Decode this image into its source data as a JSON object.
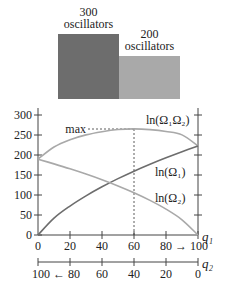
{
  "illustration": {
    "system1_label": [
      "300",
      "oscillators"
    ],
    "system2_label": [
      "200",
      "oscillators"
    ],
    "system1_color": "#6d6d6d",
    "system2_color": "#a9a9a9"
  },
  "chart_data": {
    "type": "line",
    "title": "",
    "xlabel": "q1",
    "x2label": "q2",
    "ylabel": "",
    "xlim": [
      0,
      100
    ],
    "ylim": [
      0,
      300
    ],
    "grid": false,
    "x_ticks": [
      0,
      20,
      40,
      60,
      80,
      100
    ],
    "x_tick_labels": [
      "0",
      "20",
      "40",
      "60",
      "80 → 100"
    ],
    "x2_ticks": [
      100,
      80,
      60,
      40,
      20,
      0
    ],
    "x2_tick_labels": [
      "100 ← 80",
      "60",
      "40",
      "20",
      "0"
    ],
    "y_ticks": [
      0,
      50,
      100,
      150,
      200,
      250,
      300
    ],
    "y_tick_labels": [
      "0",
      "50",
      "100",
      "150",
      "200",
      "250",
      "300"
    ],
    "x": [
      0,
      10,
      20,
      30,
      40,
      50,
      60,
      70,
      80,
      90,
      100
    ],
    "series": [
      {
        "name": "ln(Ω₁Ω₂)",
        "color": "#a9a9a9",
        "values": [
          189.6,
          219.9,
          238.2,
          250.3,
          258.2,
          263.6,
          265.3,
          263.5,
          258.8,
          250.3,
          222.7
        ]
      },
      {
        "name": "ln(Ω₁)",
        "color": "#6d6d6d",
        "values": [
          0,
          42.1,
          72.4,
          97.9,
          120.5,
          140.9,
          159.6,
          176.9,
          193.0,
          208.2,
          222.7
        ]
      },
      {
        "name": "ln(Ω₂)",
        "color": "#a9a9a9",
        "values": [
          189.6,
          177.8,
          165.5,
          152.4,
          138.2,
          122.7,
          105.7,
          86.6,
          64.8,
          38.1,
          0
        ]
      }
    ],
    "annotations": [
      {
        "text": "max",
        "x": 60,
        "y": 265
      }
    ],
    "labels": {
      "sum": "ln(Ω₁Ω₂)",
      "omega1": "ln(Ω₁)",
      "omega2": "ln(Ω₂)",
      "q1": "q₁",
      "q2": "q₂",
      "max": "max"
    }
  }
}
